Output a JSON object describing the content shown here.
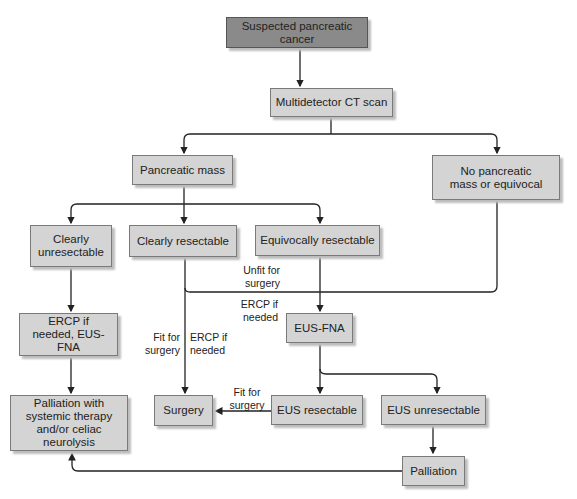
{
  "diagram": {
    "nodes": {
      "start": "Suspected pancreatic cancer",
      "ct_scan": "Multidetector CT scan",
      "pancreatic_mass": "Pancreatic mass",
      "no_mass": "No pancreatic mass or equivocal",
      "clearly_unresectable": "Clearly unresectable",
      "clearly_resectable": "Clearly resectable",
      "equivocally_resectable": "Equivocally resectable",
      "eus_fna": "EUS-FNA",
      "ercp_eus_fna": "ERCP if needed, EUS-FNA",
      "palliation_systemic": "Palliation with systemic therapy and/or celiac neurolysis",
      "surgery": "Surgery",
      "eus_resectable": "EUS resectable",
      "eus_unresectable": "EUS unresectable",
      "palliation": "Palliation"
    },
    "edge_labels": {
      "unfit_for_surgery": "Unfit for surgery",
      "ercp_if_needed_1": "ERCP if needed",
      "fit_for_surgery_1": "Fit for surgery",
      "ercp_if_needed_2": "ERCP if needed",
      "fit_for_surgery_2": "Fit for surgery"
    },
    "edges": [
      {
        "from": "start",
        "to": "ct_scan"
      },
      {
        "from": "ct_scan",
        "to": "pancreatic_mass"
      },
      {
        "from": "ct_scan",
        "to": "no_mass"
      },
      {
        "from": "pancreatic_mass",
        "to": "clearly_unresectable"
      },
      {
        "from": "pancreatic_mass",
        "to": "clearly_resectable"
      },
      {
        "from": "pancreatic_mass",
        "to": "equivocally_resectable"
      },
      {
        "from": "clearly_unresectable",
        "to": "ercp_eus_fna"
      },
      {
        "from": "ercp_eus_fna",
        "to": "palliation_systemic"
      },
      {
        "from": "clearly_resectable",
        "to": "surgery",
        "label": "Fit for surgery / ERCP if needed"
      },
      {
        "from": "clearly_resectable",
        "to": "eus_fna",
        "label": "Unfit for surgery / ERCP if needed"
      },
      {
        "from": "equivocally_resectable",
        "to": "eus_fna"
      },
      {
        "from": "no_mass",
        "to": "eus_fna"
      },
      {
        "from": "eus_fna",
        "to": "eus_resectable"
      },
      {
        "from": "eus_fna",
        "to": "eus_unresectable"
      },
      {
        "from": "eus_resectable",
        "to": "surgery",
        "label": "Fit for surgery"
      },
      {
        "from": "eus_unresectable",
        "to": "palliation"
      },
      {
        "from": "palliation",
        "to": "palliation_systemic"
      }
    ],
    "colors": {
      "start_fill": "#8a8a8a",
      "node_fill": "#d4d4d4",
      "line": "#222222"
    }
  }
}
